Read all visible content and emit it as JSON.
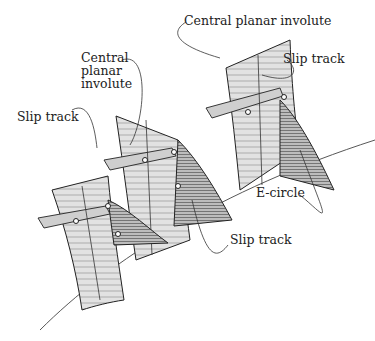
{
  "diagram": {
    "labels": {
      "central_planar_involute_top": "Central planar involute",
      "slip_track_top": "Slip track",
      "central_planar_involute_left": "Central\nplanar\ninvolute",
      "slip_track_left": "Slip track",
      "e_circle": "E-circle",
      "slip_track_bottom": "Slip track"
    },
    "teeth_count": 3,
    "colors": {
      "line": "#333333",
      "fill_light": "#d8d8d8",
      "fill_dark": "#9a9a9a",
      "background": "#ffffff"
    }
  }
}
